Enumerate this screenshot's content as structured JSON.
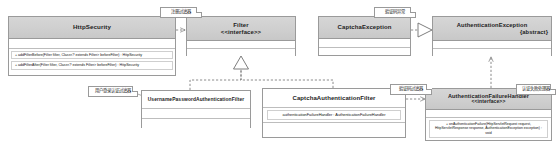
{
  "diagram": {
    "type": "uml-class-diagram",
    "background": "#ffffff",
    "header_fill": "#d0d0d0",
    "border_color": "#9a9a9a",
    "note_fill": "#ffffff"
  },
  "classes": [
    {
      "id": "httpsecurity",
      "name": "HttpSecurity",
      "stereotype": "",
      "abstract_tag": "",
      "attributes": [],
      "operations": [
        "+ addFilterBefore(Filter filter, Class<? extends Filter> beforeFilter) : HttpSecurity",
        "+ addFilterAfter(Filter filter, Class<? extends Filter> beforeFilter) : HttpSecurity"
      ]
    },
    {
      "id": "filter",
      "name": "Filter",
      "stereotype": "<<interface>>",
      "abstract_tag": "",
      "attributes": [],
      "operations": []
    },
    {
      "id": "captchaexception",
      "name": "CaptchaException",
      "stereotype": "",
      "abstract_tag": "",
      "attributes": [],
      "operations": []
    },
    {
      "id": "authenticationexception",
      "name": "AuthenticationException",
      "stereotype": "",
      "abstract_tag": "{abstract}",
      "attributes": [],
      "operations": []
    },
    {
      "id": "usernamepasswordauthenticationfilter",
      "name": "UsernamePasswordAuthenticationFilter",
      "stereotype": "",
      "abstract_tag": "",
      "attributes": [],
      "operations": []
    },
    {
      "id": "captchaauthenticationfilter",
      "name": "CaptchaAuthenticationFilter",
      "stereotype": "",
      "abstract_tag": "",
      "attributes": [
        "authenticationFailureHandler : AuthenticationFailureHandler"
      ],
      "operations": []
    },
    {
      "id": "authenticationfailurehandler",
      "name": "AuthenticationFailureHandler",
      "stereotype": "<<interface>>",
      "abstract_tag": "",
      "attributes": [],
      "operations": [
        "+ onAuthenticationFailure(HttpServletRequest request, HttpServletResponse response, AuthenticationException exception) : void"
      ]
    }
  ],
  "notes": [
    {
      "id": "note-httpsecurity",
      "text": "注册过滤器"
    },
    {
      "id": "note-captchaexception",
      "text": "验证码异常"
    },
    {
      "id": "note-usernamepassword",
      "text": "用户登录认证过滤器"
    },
    {
      "id": "note-captchafilter",
      "text": "验证码过滤器"
    },
    {
      "id": "note-failurehandler",
      "text": "认证失败处理器"
    }
  ],
  "relations": [
    {
      "id": "rel-httpsecurity-filter",
      "from": "httpsecurity",
      "to": "filter",
      "type": "dependency",
      "style": "dashed-open-arrow"
    },
    {
      "id": "rel-usernamepassword-filter",
      "from": "usernamepasswordauthenticationfilter",
      "to": "filter",
      "type": "realization",
      "style": "dashed-hollow-triangle"
    },
    {
      "id": "rel-captchafilter-filter",
      "from": "captchaauthenticationfilter",
      "to": "filter",
      "type": "realization",
      "style": "dashed-hollow-triangle"
    },
    {
      "id": "rel-captchaexception-authexception",
      "from": "captchaexception",
      "to": "authenticationexception",
      "type": "generalization",
      "style": "solid-hollow-triangle"
    },
    {
      "id": "rel-failurehandler-authexception",
      "from": "authenticationfailurehandler",
      "to": "authenticationexception",
      "type": "dependency",
      "style": "dashed-open-arrow"
    },
    {
      "id": "rel-captchafilter-failurehandler",
      "from": "captchaauthenticationfilter",
      "to": "authenticationfailurehandler",
      "type": "association",
      "style": "dashed-open-arrow"
    }
  ]
}
